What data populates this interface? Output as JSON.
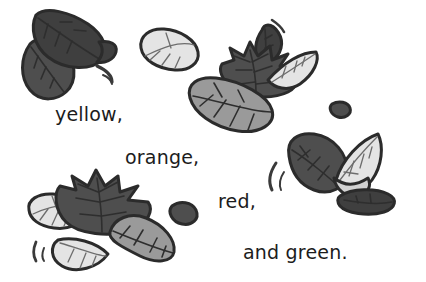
{
  "page": {
    "background_color": "#ffffff",
    "width": 426,
    "height": 282,
    "illustration_title": "falling autumn leaves"
  },
  "captions": [
    {
      "id": "yellow",
      "text": "yellow,"
    },
    {
      "id": "orange",
      "text": "orange,"
    },
    {
      "id": "red",
      "text": "red,"
    },
    {
      "id": "green",
      "text": "and green."
    }
  ],
  "palette": {
    "outline": "#2b2b2b",
    "leaf_dark": "#4e4e4e",
    "leaf_dark_shade": "#3f3f3f",
    "leaf_mid": "#9a9a9a",
    "leaf_mid_shade": "#8a8a8a",
    "leaf_light": "#e4e4e4",
    "leaf_light_shade": "#d2d2d2",
    "vein": "#2e2e2e",
    "vein_light": "#8f8f8f",
    "text": "#1c1c1c"
  },
  "leaf_groups": [
    {
      "name": "top-left-cluster",
      "leaves": [
        {
          "name": "dark-pointed-leaf-upper",
          "tone": "dark"
        },
        {
          "name": "dark-pointed-leaf-lower",
          "tone": "dark"
        }
      ],
      "motion_marks": 2
    },
    {
      "name": "top-center-light-leaf",
      "leaves": [
        {
          "name": "light-oval-leaf",
          "tone": "light"
        }
      ],
      "motion_marks": 0
    },
    {
      "name": "top-right-cluster",
      "leaves": [
        {
          "name": "dark-teardrop-leaf",
          "tone": "dark"
        },
        {
          "name": "dark-maple-leaf",
          "tone": "dark"
        },
        {
          "name": "light-sliver-leaf",
          "tone": "light"
        },
        {
          "name": "mid-gray-broad-leaf",
          "tone": "mid"
        }
      ],
      "motion_marks": 1
    },
    {
      "name": "right-cluster",
      "leaves": [
        {
          "name": "dark-round-leaf",
          "tone": "dark"
        },
        {
          "name": "light-curved-leaf",
          "tone": "light"
        },
        {
          "name": "dark-flat-leaf",
          "tone": "dark"
        }
      ],
      "motion_marks": 2
    },
    {
      "name": "bottom-left-cluster",
      "leaves": [
        {
          "name": "light-oval-leaf-small",
          "tone": "light"
        },
        {
          "name": "dark-maple-leaf-large",
          "tone": "dark"
        },
        {
          "name": "mid-gray-pointed-leaf",
          "tone": "mid"
        },
        {
          "name": "light-crescent-leaf",
          "tone": "light"
        }
      ],
      "motion_marks": 2
    },
    {
      "name": "small-fragments",
      "leaves": [
        {
          "name": "dark-crescent-fragment-center",
          "tone": "dark"
        },
        {
          "name": "dark-pebble-fragment-right",
          "tone": "dark"
        }
      ],
      "motion_marks": 0
    }
  ]
}
